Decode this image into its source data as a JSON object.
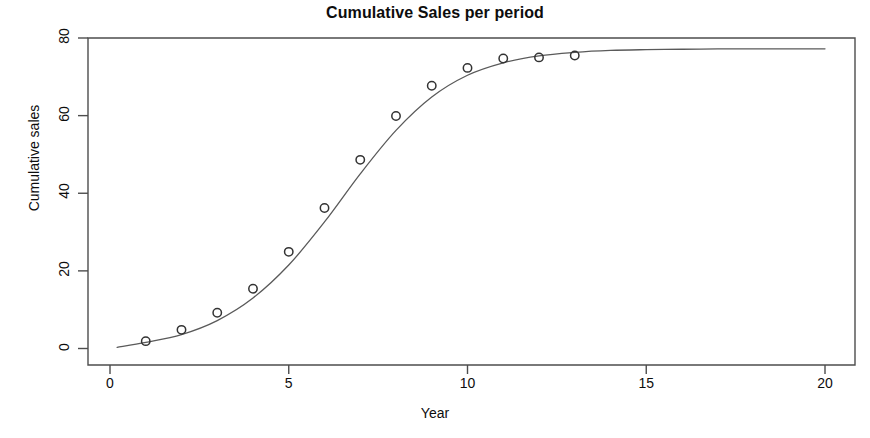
{
  "chart_data": {
    "type": "scatter",
    "title": "Cumulative Sales per period",
    "xlabel": "Year",
    "ylabel": "Cumulative sales",
    "xlim": [
      0,
      20
    ],
    "ylim": [
      0,
      80
    ],
    "xticks": [
      0,
      5,
      10,
      15,
      20
    ],
    "yticks": [
      0,
      20,
      40,
      60,
      80
    ],
    "grid": false,
    "legend": "none",
    "series": [
      {
        "name": "Observed cumulative sales",
        "marker": "open-circle",
        "color": "#333333",
        "x": [
          1,
          2,
          3,
          4,
          5,
          6,
          7,
          8,
          9,
          10,
          11,
          12,
          13
        ],
        "values": [
          1.9,
          4.8,
          9.2,
          15.4,
          24.9,
          36.2,
          48.6,
          59.9,
          67.7,
          72.3,
          74.7,
          75.0,
          75.5
        ]
      },
      {
        "name": "Fitted diffusion curve",
        "marker": "line",
        "color": "#5a5a5a",
        "x": [
          0.2,
          1,
          2,
          3,
          4,
          5,
          6,
          7,
          8,
          9,
          10,
          11,
          12,
          13,
          14,
          15,
          16,
          17,
          18,
          19,
          20
        ],
        "values": [
          0.3,
          1.6,
          3.6,
          7.2,
          13.0,
          21.5,
          32.6,
          45.0,
          56.2,
          64.8,
          70.4,
          73.6,
          75.4,
          76.3,
          76.8,
          77.0,
          77.1,
          77.2,
          77.2,
          77.2,
          77.2
        ]
      }
    ]
  },
  "figure": {
    "background_color": "#ffffff",
    "axis_color": "#4d4d4d",
    "point_color": "#333333",
    "curve_color": "#5a5a5a"
  }
}
